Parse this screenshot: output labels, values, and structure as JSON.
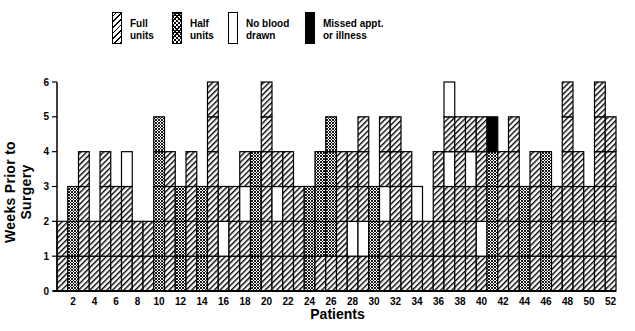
{
  "chart_data": {
    "type": "bar",
    "subtype": "stacked-segments",
    "title": "",
    "xlabel": "Patients",
    "ylabel": "Weeks Prior to Surgery",
    "ylim": [
      0,
      6
    ],
    "yticks": [
      0,
      1,
      2,
      3,
      4,
      5,
      6
    ],
    "xticks": [
      2,
      4,
      6,
      8,
      10,
      12,
      14,
      16,
      18,
      20,
      22,
      24,
      26,
      28,
      30,
      32,
      34,
      36,
      38,
      40,
      42,
      44,
      46,
      48,
      50,
      52
    ],
    "grid": false,
    "legend_position": "top",
    "legend": [
      {
        "key": "F",
        "label": "Full\nunits",
        "pattern": "diagonal-hatch"
      },
      {
        "key": "H",
        "label": "Half\nunits",
        "pattern": "cross-hatch"
      },
      {
        "key": "N",
        "label": "No blood\ndrawn",
        "pattern": "white"
      },
      {
        "key": "M",
        "label": "Missed appt.\nor illness",
        "pattern": "solid-black"
      }
    ],
    "note": "Each patient bar is stacked in 1-week segments from week 0 upward; letters give the segment type bottom-to-top.",
    "patients": [
      {
        "id": 1,
        "weeks": [
          "F",
          "F"
        ]
      },
      {
        "id": 2,
        "weeks": [
          "H",
          "H",
          "H"
        ]
      },
      {
        "id": 3,
        "weeks": [
          "F",
          "F",
          "F",
          "F"
        ]
      },
      {
        "id": 4,
        "weeks": [
          "F",
          "F"
        ]
      },
      {
        "id": 5,
        "weeks": [
          "F",
          "F",
          "F",
          "F"
        ]
      },
      {
        "id": 6,
        "weeks": [
          "F",
          "F",
          "F"
        ]
      },
      {
        "id": 7,
        "weeks": [
          "F",
          "F",
          "F",
          "N"
        ]
      },
      {
        "id": 8,
        "weeks": [
          "F",
          "F"
        ]
      },
      {
        "id": 9,
        "weeks": [
          "F",
          "F"
        ]
      },
      {
        "id": 10,
        "weeks": [
          "H",
          "H",
          "H",
          "H",
          "H"
        ]
      },
      {
        "id": 11,
        "weeks": [
          "F",
          "F",
          "F",
          "F"
        ]
      },
      {
        "id": 12,
        "weeks": [
          "H",
          "H",
          "H"
        ]
      },
      {
        "id": 13,
        "weeks": [
          "F",
          "F",
          "F",
          "F"
        ]
      },
      {
        "id": 14,
        "weeks": [
          "H",
          "H",
          "H"
        ]
      },
      {
        "id": 15,
        "weeks": [
          "F",
          "F",
          "F",
          "F",
          "F",
          "F"
        ]
      },
      {
        "id": 16,
        "weeks": [
          "F",
          "N",
          "F"
        ]
      },
      {
        "id": 17,
        "weeks": [
          "F",
          "F",
          "F"
        ]
      },
      {
        "id": 18,
        "weeks": [
          "F",
          "F",
          "N",
          "F"
        ]
      },
      {
        "id": 19,
        "weeks": [
          "H",
          "H",
          "H",
          "H"
        ]
      },
      {
        "id": 20,
        "weeks": [
          "F",
          "F",
          "F",
          "F",
          "F",
          "F"
        ]
      },
      {
        "id": 21,
        "weeks": [
          "F",
          "F",
          "N",
          "F"
        ]
      },
      {
        "id": 22,
        "weeks": [
          "F",
          "F",
          "F",
          "F"
        ]
      },
      {
        "id": 23,
        "weeks": [
          "F",
          "F",
          "F"
        ]
      },
      {
        "id": 24,
        "weeks": [
          "H",
          "H",
          "H"
        ]
      },
      {
        "id": 25,
        "weeks": [
          "F",
          "H",
          "H",
          "H"
        ]
      },
      {
        "id": 26,
        "weeks": [
          "F",
          "H",
          "H",
          "H",
          "H"
        ]
      },
      {
        "id": 27,
        "weeks": [
          "F",
          "F",
          "F",
          "F"
        ]
      },
      {
        "id": 28,
        "weeks": [
          "F",
          "N",
          "F",
          "F"
        ]
      },
      {
        "id": 29,
        "weeks": [
          "F",
          "N",
          "F",
          "F",
          "F"
        ]
      },
      {
        "id": 30,
        "weeks": [
          "H",
          "H",
          "H"
        ]
      },
      {
        "id": 31,
        "weeks": [
          "F",
          "F",
          "N",
          "F",
          "F"
        ]
      },
      {
        "id": 32,
        "weeks": [
          "F",
          "F",
          "F",
          "F",
          "F"
        ]
      },
      {
        "id": 33,
        "weeks": [
          "F",
          "F",
          "F",
          "F"
        ]
      },
      {
        "id": 34,
        "weeks": [
          "F",
          "F",
          "N"
        ]
      },
      {
        "id": 35,
        "weeks": [
          "F",
          "F"
        ]
      },
      {
        "id": 36,
        "weeks": [
          "F",
          "F",
          "F",
          "F"
        ]
      },
      {
        "id": 37,
        "weeks": [
          "F",
          "F",
          "F",
          "N",
          "F",
          "N"
        ]
      },
      {
        "id": 38,
        "weeks": [
          "F",
          "F",
          "F",
          "F",
          "F"
        ]
      },
      {
        "id": 39,
        "weeks": [
          "F",
          "F",
          "F",
          "N",
          "F"
        ]
      },
      {
        "id": 40,
        "weeks": [
          "F",
          "N",
          "F",
          "F",
          "F"
        ]
      },
      {
        "id": 41,
        "weeks": [
          "H",
          "H",
          "H",
          "H",
          "M"
        ]
      },
      {
        "id": 42,
        "weeks": [
          "F",
          "F",
          "F",
          "F"
        ]
      },
      {
        "id": 43,
        "weeks": [
          "F",
          "F",
          "F",
          "F",
          "F"
        ]
      },
      {
        "id": 44,
        "weeks": [
          "H",
          "H",
          "H"
        ]
      },
      {
        "id": 45,
        "weeks": [
          "F",
          "F",
          "F",
          "F"
        ]
      },
      {
        "id": 46,
        "weeks": [
          "H",
          "H",
          "H",
          "H"
        ]
      },
      {
        "id": 47,
        "weeks": [
          "F",
          "F",
          "F"
        ]
      },
      {
        "id": 48,
        "weeks": [
          "F",
          "F",
          "F",
          "F",
          "F",
          "F"
        ]
      },
      {
        "id": 49,
        "weeks": [
          "F",
          "F",
          "F",
          "F"
        ]
      },
      {
        "id": 50,
        "weeks": [
          "F",
          "F",
          "F"
        ]
      },
      {
        "id": 51,
        "weeks": [
          "F",
          "F",
          "F",
          "F",
          "F",
          "F"
        ]
      },
      {
        "id": 52,
        "weeks": [
          "F",
          "F",
          "F",
          "F",
          "F"
        ]
      }
    ],
    "totals": [
      2,
      3,
      4,
      2,
      4,
      3,
      4,
      2,
      2,
      5,
      4,
      3,
      4,
      3,
      6,
      3,
      3,
      4,
      4,
      6,
      4,
      4,
      3,
      3,
      4,
      5,
      4,
      4,
      5,
      3,
      5,
      5,
      4,
      3,
      2,
      4,
      6,
      5,
      5,
      5,
      5,
      4,
      5,
      3,
      4,
      4,
      3,
      6,
      4,
      3,
      6,
      5
    ]
  },
  "legend": {
    "full": "Full\nunits",
    "half": "Half\nunits",
    "none": "No blood\ndrawn",
    "missed": "Missed appt.\nor illness"
  },
  "axes": {
    "ylabel": "Weeks Prior to Surgery",
    "xlabel": "Patients"
  }
}
